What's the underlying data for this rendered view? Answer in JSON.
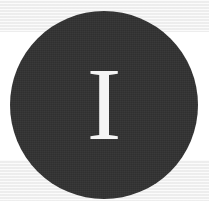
{
  "image": {
    "kind": "monogram-avatar",
    "width": 209,
    "height": 201,
    "description": "Dark circular avatar badge with a white serif capital letter monogram on a light banded background"
  },
  "avatar": {
    "monogram": "I",
    "letter_color": "#f5f5f5",
    "disc_color": "#333333",
    "shape": "circle",
    "diameter_px": 188,
    "center_x": 104,
    "center_y": 105
  },
  "background": {
    "base_color": "#ffffff",
    "band_color": "#f0f0f0",
    "bands": [
      {
        "name": "top-band",
        "top": 0,
        "height": 32,
        "color": "#f0f0f0"
      },
      {
        "name": "middle-band",
        "top": 32,
        "height": 128,
        "color": "#ffffff"
      },
      {
        "name": "bottom-band",
        "top": 160,
        "height": 41,
        "color": "#f0f0f0"
      }
    ]
  }
}
